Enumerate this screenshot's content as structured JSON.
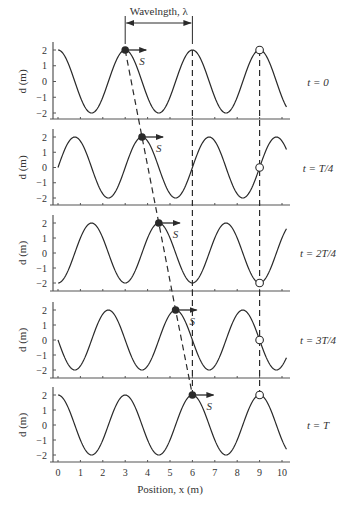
{
  "figure": {
    "wavelength_label": "Wavelngth, λ",
    "speed_label": "S",
    "y_axis_label": "d (m)",
    "x_axis_label": "Position, x (m)",
    "colors": {
      "line": "#2a2a2a",
      "axis": "#555555",
      "text": "#333333",
      "marker": "#2a2a2a",
      "open_marker_fill": "#ffffff"
    }
  },
  "chart_data": {
    "type": "line",
    "title": "",
    "xlabel": "Position, x (m)",
    "ylabel": "d (m)",
    "xlim": [
      0,
      10
    ],
    "ylim": [
      -2,
      2
    ],
    "x_ticks": [
      0,
      1,
      2,
      3,
      4,
      5,
      6,
      7,
      8,
      9,
      10
    ],
    "y_ticks": [
      2,
      1,
      0,
      -1,
      -2
    ],
    "amplitude": 2,
    "wavelength": 3,
    "x_max_curve": 10.2,
    "panels": [
      {
        "time_label": "t = 0",
        "shift": 0.0,
        "marker_x": 3.0,
        "open_x": 9,
        "open_d": 2
      },
      {
        "time_label": "t = T/4",
        "shift": 0.75,
        "marker_x": 3.75,
        "open_x": 9,
        "open_d": 0
      },
      {
        "time_label": "t = 2T/4",
        "shift": 1.5,
        "marker_x": 4.5,
        "open_x": 9,
        "open_d": -2
      },
      {
        "time_label": "t = 3T/4",
        "shift": 2.25,
        "marker_x": 5.25,
        "open_x": 9,
        "open_d": 0
      },
      {
        "time_label": "t = T",
        "shift": 3.0,
        "marker_x": 6.0,
        "open_x": 9,
        "open_d": 2
      }
    ],
    "wavelength_bracket": {
      "from_x": 3,
      "to_x": 6
    }
  }
}
